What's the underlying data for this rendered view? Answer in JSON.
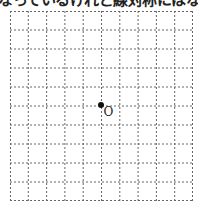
{
  "caption": "なっているけれど線対称にはなっている",
  "grid": {
    "columns": 10,
    "rows": 10,
    "line_style": "dashed",
    "line_color": "#666666"
  },
  "origin": {
    "label": "O",
    "column": 5,
    "row": 5
  }
}
